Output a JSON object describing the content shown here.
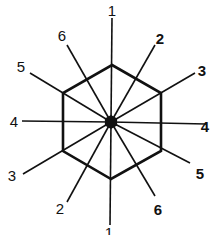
{
  "diagram": {
    "center": {
      "x": 111,
      "y": 122
    },
    "hexagon": [
      [
        112,
        65
      ],
      [
        161,
        93
      ],
      [
        161,
        151
      ],
      [
        111,
        179
      ],
      [
        63,
        151
      ],
      [
        63,
        93
      ]
    ],
    "spokes": [
      {
        "label": "1",
        "end": [
          112,
          18
        ],
        "label_pos": [
          112,
          10
        ],
        "bold": false
      },
      {
        "label": "2",
        "end": [
          155,
          45
        ],
        "label_pos": [
          160,
          38
        ],
        "bold": true
      },
      {
        "label": "3",
        "end": [
          195,
          73
        ],
        "label_pos": [
          202,
          70
        ],
        "bold": true
      },
      {
        "label": "4",
        "end": [
          206,
          124
        ],
        "label_pos": [
          205,
          126
        ],
        "bold": true
      },
      {
        "label": "5",
        "end": [
          190,
          163
        ],
        "label_pos": [
          200,
          173
        ],
        "bold": true
      },
      {
        "label": "6",
        "end": [
          155,
          196
        ],
        "label_pos": [
          158,
          209
        ],
        "bold": true
      },
      {
        "label": "1",
        "end": [
          110,
          225
        ],
        "label_pos": [
          109,
          232
        ],
        "bold": false
      },
      {
        "label": "2",
        "end": [
          67,
          202
        ],
        "label_pos": [
          60,
          208
        ],
        "bold": false
      },
      {
        "label": "3",
        "end": [
          23,
          174
        ],
        "label_pos": [
          12,
          175
        ],
        "bold": false
      },
      {
        "label": "4",
        "end": [
          22,
          121
        ],
        "label_pos": [
          14,
          121
        ],
        "bold": false
      },
      {
        "label": "5",
        "end": [
          30,
          73
        ],
        "label_pos": [
          21,
          66
        ],
        "bold": false
      },
      {
        "label": "6",
        "end": [
          67,
          45
        ],
        "label_pos": [
          62,
          35
        ],
        "bold": false
      }
    ]
  },
  "labels": [
    "1",
    "2",
    "3",
    "4",
    "5",
    "6",
    "1",
    "2",
    "3",
    "4",
    "5",
    "6"
  ]
}
